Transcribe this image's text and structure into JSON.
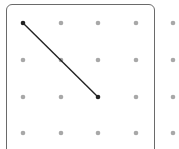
{
  "geoboard": {
    "columns_x": [
      23,
      61,
      98,
      136,
      173
    ],
    "rows_y": [
      23,
      60,
      97,
      133
    ],
    "dot_color": "#a8a8a8",
    "line_color": "#222222",
    "frame_color": "#6a6a6a",
    "segment": {
      "from": [
        0,
        0
      ],
      "to": [
        2,
        2
      ]
    }
  }
}
